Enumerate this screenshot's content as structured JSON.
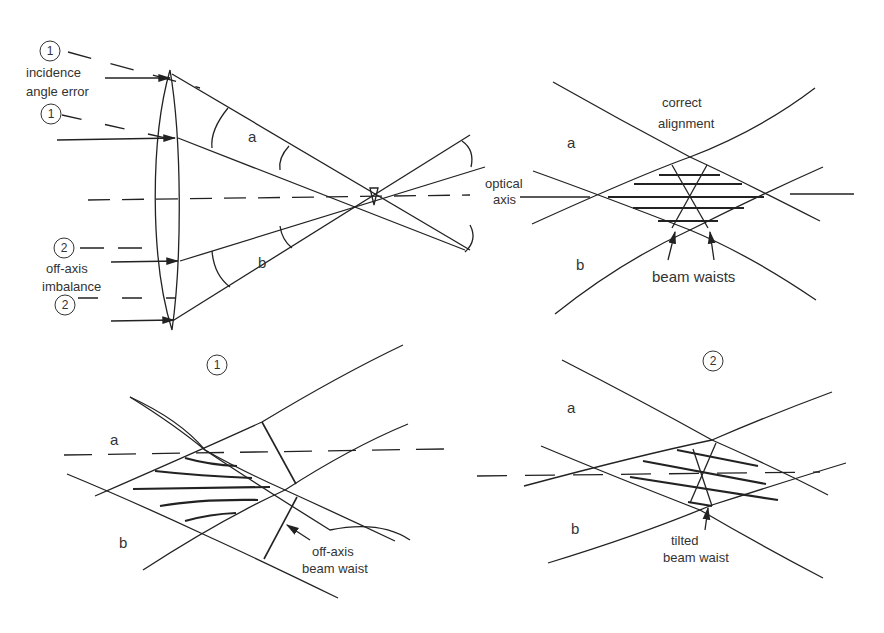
{
  "panel_lens": {
    "markers": [
      "1",
      "1",
      "2",
      "2"
    ],
    "incidence_label_line1": "incidence",
    "incidence_label_line2": "angle error",
    "offaxis_label_line1": "off-axis",
    "offaxis_label_line2": "imbalance",
    "beam_a": "a",
    "beam_b": "b",
    "optical_axis_line1": "optical",
    "optical_axis_line2": "axis"
  },
  "panel_correct": {
    "title_line1": "correct",
    "title_line2": "alignment",
    "beam_a": "a",
    "beam_b": "b",
    "waist_label": "beam waists"
  },
  "panel_1": {
    "marker": "1",
    "beam_a": "a",
    "beam_b": "b",
    "waist_label_line1": "off-axis",
    "waist_label_line2": "beam waist"
  },
  "panel_2": {
    "marker": "2",
    "beam_a": "a",
    "beam_b": "b",
    "waist_label_line1": "tilted",
    "waist_label_line2": "beam waist"
  }
}
